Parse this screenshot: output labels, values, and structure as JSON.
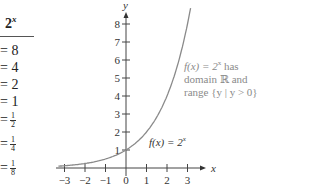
{
  "table": {
    "header": "2",
    "header_exp": "x",
    "rows": [
      {
        "text": "= 8"
      },
      {
        "text": "= 4"
      },
      {
        "text": "= 2"
      },
      {
        "text": "= 1"
      },
      {
        "text": "=",
        "num": "1",
        "den": "2"
      },
      {
        "text": "=",
        "num": "1",
        "den": "4"
      },
      {
        "text": "=",
        "num": "1",
        "den": "8"
      }
    ]
  },
  "chart_data": {
    "type": "line",
    "title": "",
    "xlabel": "x",
    "ylabel": "y",
    "x_ticks": [
      "-3",
      "-2",
      "-1",
      "0",
      "1",
      "2",
      "3"
    ],
    "y_ticks": [
      "1",
      "2",
      "3",
      "4",
      "5",
      "6",
      "7",
      "8"
    ],
    "xlim": [
      -3.3,
      3.6
    ],
    "ylim": [
      0,
      8.7
    ],
    "series": [
      {
        "name": "f(x) = 2^x",
        "x": [
          -3,
          -2,
          -1,
          0,
          1,
          2,
          3
        ],
        "y": [
          0.125,
          0.25,
          0.5,
          1,
          2,
          4,
          8
        ]
      }
    ],
    "annotations": [
      "f(x) = 2^x has domain ℝ and range {y | y > 0}",
      "f(x) = 2^x"
    ]
  },
  "labels": {
    "y_axis": "y",
    "x_axis": "x",
    "curve_label": "f(x) = 2",
    "curve_label_exp": "x",
    "note_line1": "f(x) = 2",
    "note_line1_exp": "x",
    "note_line1_tail": " has",
    "note_line2": "domain ℝ and",
    "note_line3": "range {y | y > 0}"
  },
  "colors": {
    "curve": "#8a8a8a",
    "axis": "#444444",
    "note": "#8a8a8a"
  }
}
